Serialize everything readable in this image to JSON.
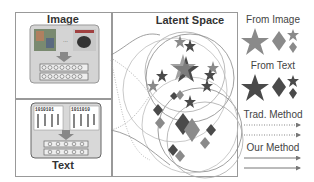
{
  "panels": {
    "image": {
      "title": "Image"
    },
    "text": {
      "title": "Text",
      "token_row_a": "1010101",
      "token_row_b": "1011010"
    },
    "latent": {
      "title": "Latent Space"
    }
  },
  "legend": {
    "from_image": "From Image",
    "from_text": "From Text",
    "trad_method": "Trad. Method",
    "our_method": "Our Method"
  },
  "colors": {
    "image_shape": "#8a8a8a",
    "text_shape": "#4a4a4a",
    "frame": "#999999",
    "panel_bg": "#d8d8d8"
  }
}
